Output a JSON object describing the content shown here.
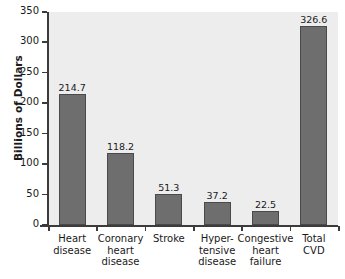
{
  "chart_data": {
    "type": "bar",
    "title": "",
    "xlabel": "",
    "ylabel": "Billions of Dollars",
    "ylim": [
      0,
      350
    ],
    "yticks": [
      0,
      50,
      100,
      150,
      200,
      250,
      300,
      350
    ],
    "ytick_labels": [
      "0",
      "50",
      "100",
      "150",
      "200",
      "250",
      "300",
      "350"
    ],
    "grid": false,
    "legend": "none",
    "categories": [
      "Heart\ndisease",
      "Coronary\nheart\ndisease",
      "Stroke",
      "Hyper-\ntensive\ndisease",
      "Congestive\nheart\nfailure",
      "Total\nCVD"
    ],
    "values": [
      214.7,
      118.2,
      51.3,
      37.2,
      22.5,
      326.6
    ],
    "value_labels": [
      "214.7",
      "118.2",
      "51.3",
      "37.2",
      "22.5",
      "326.6"
    ],
    "colors": {
      "bar_fill": "#6e6e6e",
      "bar_stroke": "#4a4a4a",
      "plot_background": "#ededed",
      "axis": "#3b3b3b",
      "text": "#1a1a1a",
      "page_background": "#ffffff"
    }
  }
}
